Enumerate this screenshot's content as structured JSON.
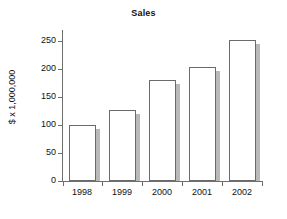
{
  "chart_data": {
    "type": "bar",
    "title": "Sales",
    "xlabel": "",
    "ylabel": "$ x 1,000,000",
    "categories": [
      "1998",
      "1999",
      "2000",
      "2001",
      "2002"
    ],
    "values": [
      100,
      127,
      180,
      203,
      253
    ],
    "ylim": [
      0,
      270
    ],
    "yticks": [
      0,
      50,
      100,
      150,
      200,
      250
    ],
    "ytick_labels": [
      "0",
      "50",
      "100",
      "150",
      "200",
      "250"
    ],
    "grid": false,
    "legend": false,
    "series": [
      {
        "name": "Sales",
        "values": [
          100,
          127,
          180,
          203,
          253
        ]
      }
    ],
    "style": {
      "bar_fill": "#ffffff",
      "bar_edge": "#6a6a6a",
      "bar_shadow": "#b9b9b9",
      "axis_color": "#6f6f6f",
      "text_color": "#111111",
      "background": "#ffffff"
    }
  }
}
